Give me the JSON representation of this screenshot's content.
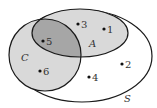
{
  "diagram": {
    "type": "venn",
    "sets": [
      {
        "name": "S",
        "label": "S",
        "role": "universal"
      },
      {
        "name": "A",
        "label": "A"
      },
      {
        "name": "C",
        "label": "C"
      }
    ],
    "elements": [
      {
        "label": "1",
        "region": "A only"
      },
      {
        "label": "2",
        "region": "S only"
      },
      {
        "label": "3",
        "region": "A only"
      },
      {
        "label": "4",
        "region": "S only"
      },
      {
        "label": "5",
        "region": "A and C"
      },
      {
        "label": "6",
        "region": "C only"
      }
    ],
    "colors": {
      "outline": "#1a1a1a",
      "single_fill": "#d9d9d9",
      "intersection_fill": "#a6a6a6",
      "background": "#ffffff"
    }
  }
}
